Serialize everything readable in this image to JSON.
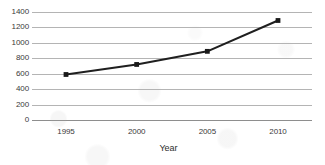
{
  "chart_data": {
    "type": "line",
    "title": "",
    "subtitle": "",
    "xlabel": "Year",
    "ylabel": "",
    "categories": [
      "1995",
      "2000",
      "2005",
      "2010"
    ],
    "x": [
      1995,
      2000,
      2005,
      2010
    ],
    "values": [
      590,
      720,
      890,
      1290
    ],
    "series": [
      {
        "name": "",
        "values": [
          590,
          720,
          890,
          1290
        ]
      }
    ],
    "ylim": [
      0,
      1400
    ],
    "ytick_labels": [
      "0",
      "200",
      "400",
      "600",
      "800",
      "1000",
      "1200",
      "1400"
    ],
    "ytick_values": [
      0,
      200,
      400,
      600,
      800,
      1000,
      1200,
      1400
    ],
    "xtick_labels": [
      "1995",
      "2000",
      "2005",
      "2010"
    ],
    "grid": "horizontal",
    "legend": "none",
    "annotations": [],
    "colors": {
      "line": "#1f1f1f",
      "marker": "#1a1a1a",
      "gridline": "#b4b4b4",
      "axis": "#8e8e8e",
      "background": "#ffffff",
      "text": "#3a3a3a"
    },
    "marker": "square"
  }
}
